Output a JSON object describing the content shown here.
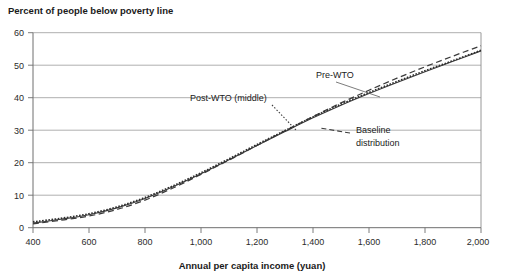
{
  "chart_data": {
    "type": "line",
    "title": "Percent of people below poverty line",
    "xlabel": "Annual per capita income (yuan)",
    "ylabel": "",
    "xlim": [
      400,
      2000
    ],
    "ylim": [
      0,
      60
    ],
    "grid": true,
    "legend_position": "inline-annotations",
    "xticks": [
      "400",
      "600",
      "800",
      "1,000",
      "1,200",
      "1,400",
      "1,600",
      "1,800",
      "2,000"
    ],
    "xtick_values": [
      400,
      600,
      800,
      1000,
      1200,
      1400,
      1600,
      1800,
      2000
    ],
    "yticks": [
      "0",
      "10",
      "20",
      "30",
      "40",
      "50",
      "60"
    ],
    "ytick_values": [
      0,
      10,
      20,
      30,
      40,
      50,
      60
    ],
    "x": [
      400,
      500,
      600,
      700,
      800,
      900,
      1000,
      1100,
      1200,
      1300,
      1400,
      1500,
      1600,
      1700,
      1800,
      1900,
      2000
    ],
    "series": [
      {
        "name": "Pre-WTO",
        "style": "solid",
        "color": "#3b3b3b",
        "values": [
          1.4,
          2.6,
          4.0,
          6.1,
          9.0,
          12.6,
          16.6,
          20.9,
          25.3,
          29.6,
          33.8,
          37.7,
          41.3,
          44.7,
          48.0,
          51.2,
          54.4
        ]
      },
      {
        "name": "Post-WTO (middle)",
        "style": "dotted",
        "color": "#2e2e2e",
        "values": [
          1.8,
          2.9,
          4.3,
          6.4,
          9.3,
          12.9,
          16.9,
          21.2,
          25.6,
          29.9,
          34.1,
          38.0,
          41.6,
          45.0,
          48.3,
          51.4,
          54.6
        ]
      },
      {
        "name": "Baseline distribution",
        "style": "dashed",
        "color": "#3b3b3b",
        "values": [
          1.2,
          2.3,
          3.6,
          5.6,
          8.5,
          12.2,
          16.4,
          20.8,
          25.3,
          29.8,
          34.2,
          38.4,
          42.3,
          46.0,
          49.5,
          52.8,
          56.0
        ]
      }
    ],
    "annotations": [
      {
        "name": "pre-wto",
        "text": "Pre-WTO",
        "label_x": 1520,
        "label_y": 46.5,
        "leader_to_x": 1620,
        "leader_to_y": 40.8
      },
      {
        "name": "post-wto",
        "text": "Post-WTO (middle)",
        "label_x": 1100,
        "label_y": 39.0,
        "leader_to_x": 1355,
        "leader_to_y": 31.0
      },
      {
        "name": "baseline",
        "text_line1": "Baseline",
        "text_line2": "distribution",
        "label_x": 1600,
        "label_y": 29.5,
        "leader_to_x": 1465,
        "leader_to_y": 29.7
      }
    ]
  }
}
